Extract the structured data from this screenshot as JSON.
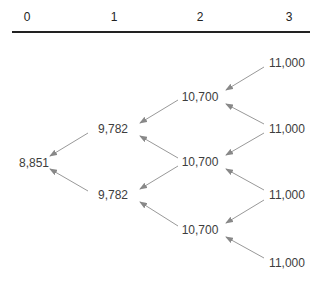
{
  "header": {
    "periods": [
      "0",
      "1",
      "2",
      "3"
    ]
  },
  "tree": {
    "t0": [
      "8,851"
    ],
    "t1": [
      "9,782",
      "9,782"
    ],
    "t2": [
      "10,700",
      "10,700",
      "10,700"
    ],
    "t3": [
      "11,000",
      "11,000",
      "11,000",
      "11,000"
    ]
  },
  "colors": {
    "rule": "#222222",
    "arrow": "#888888",
    "text": "#3d3d3d"
  }
}
